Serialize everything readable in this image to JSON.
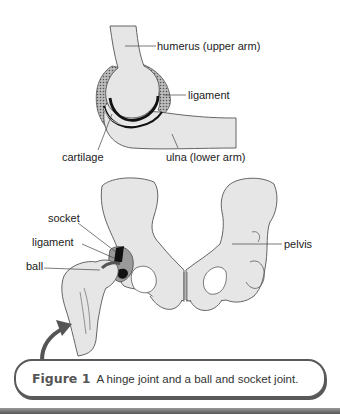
{
  "figure": {
    "number_label": "Figure 1",
    "caption": "A hinge joint and a ball and socket joint."
  },
  "hinge_joint": {
    "labels": {
      "humerus": "humerus (upper arm)",
      "ligament": "ligament",
      "cartilage": "cartilage",
      "ulna": "ulna (lower arm)"
    }
  },
  "ball_socket_joint": {
    "labels": {
      "socket": "socket",
      "ligament": "ligament",
      "ball": "ball",
      "pelvis": "pelvis"
    }
  },
  "colors": {
    "bone_fill": "#e6e6e6",
    "outline": "#555555",
    "accent_dark": "#1a1a1a",
    "caption_border": "#5a5a5a"
  }
}
